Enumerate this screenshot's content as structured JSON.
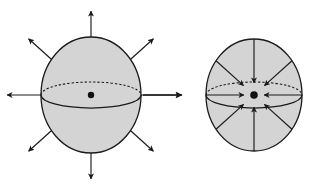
{
  "figure": {
    "title": "",
    "caption": "",
    "background_color": "#ffffff",
    "stroke_color": "#1a1a1a",
    "sphere_fill_color": "#d4d4d4",
    "center_dot_color": "#111111",
    "width": 324,
    "height": 186
  },
  "diagrams": [
    {
      "id": "outward-flow-sphere",
      "name": "sphere-outward-divergence",
      "label": "",
      "flow_direction": "outward",
      "sphere": {
        "center_x": 91,
        "center_y": 95,
        "radius_x": 50,
        "radius_y": 58
      },
      "equator": {
        "radius_x": 50,
        "radius_y": 13,
        "back_half_style": "dashed",
        "front_half_style": "solid"
      },
      "center_dot": {
        "radius": 3.2
      },
      "arrows": [
        {
          "name": "arrow-up",
          "angle_deg": 90,
          "start_r": 0.0,
          "end_len": 84
        },
        {
          "name": "arrow-down",
          "angle_deg": 270,
          "start_r": 0.0,
          "end_len": 84
        },
        {
          "name": "arrow-left",
          "angle_deg": 180,
          "start_r": 0.0,
          "end_len": 84
        },
        {
          "name": "arrow-right",
          "angle_deg": 0,
          "start_r": 0.0,
          "end_len": 90
        },
        {
          "name": "arrow-up-left",
          "angle_deg": 138,
          "start_r": 0.0,
          "end_len": 84
        },
        {
          "name": "arrow-up-right",
          "angle_deg": 42,
          "start_r": 0.0,
          "end_len": 84
        },
        {
          "name": "arrow-down-left",
          "angle_deg": 222,
          "start_r": 0.0,
          "end_len": 84
        },
        {
          "name": "arrow-down-right",
          "angle_deg": 318,
          "start_r": 0.0,
          "end_len": 84
        }
      ]
    },
    {
      "id": "inward-flow-sphere",
      "name": "sphere-inward-convergence",
      "label": "",
      "flow_direction": "inward",
      "sphere": {
        "center_x": 254,
        "center_y": 95,
        "radius_x": 48,
        "radius_y": 56
      },
      "equator": {
        "radius_x": 48,
        "radius_y": 13,
        "back_half_style": "dashed",
        "front_half_style": "solid"
      },
      "center_dot": {
        "radius": 3.8
      },
      "arrows": [
        {
          "name": "arrow-up",
          "angle_deg": 90,
          "start_r": 1.0,
          "end_len": 12
        },
        {
          "name": "arrow-down",
          "angle_deg": 270,
          "start_r": 1.0,
          "end_len": 12
        },
        {
          "name": "arrow-left",
          "angle_deg": 180,
          "start_r": 1.0,
          "end_len": 10
        },
        {
          "name": "arrow-right",
          "angle_deg": 0,
          "start_r": 1.0,
          "end_len": 10
        },
        {
          "name": "arrow-up-left",
          "angle_deg": 138,
          "start_r": 1.0,
          "end_len": 14
        },
        {
          "name": "arrow-up-right",
          "angle_deg": 42,
          "start_r": 1.0,
          "end_len": 14
        },
        {
          "name": "arrow-down-left",
          "angle_deg": 222,
          "start_r": 1.0,
          "end_len": 14
        },
        {
          "name": "arrow-down-right",
          "angle_deg": 318,
          "start_r": 1.0,
          "end_len": 14
        }
      ]
    }
  ],
  "external_arrow": {
    "name": "connector-arrow-right",
    "description": "horizontal arrow between the two spheres",
    "x1": 143,
    "y1": 95,
    "x2": 182,
    "y2": 95
  }
}
